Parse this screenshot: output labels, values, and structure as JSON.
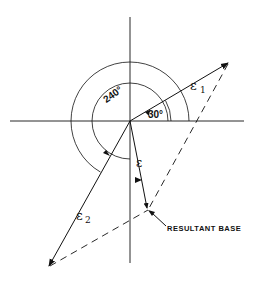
{
  "diagram": {
    "type": "phasor-vector-diagram",
    "angles": {
      "inner_arc_label": "30°",
      "outer_arc_label": "240°"
    },
    "vectors": {
      "e1": {
        "symbol": "ε",
        "subscript": "1",
        "angle_deg": 30
      },
      "e2": {
        "symbol": "ε",
        "subscript": "2",
        "angle_deg": 240
      },
      "resultant": {
        "symbol": "ε",
        "subscript": ""
      }
    },
    "annotations": {
      "resultant_label": "RESULTANT BASE"
    },
    "colors": {
      "stroke": "#111111",
      "background": "#ffffff"
    }
  }
}
